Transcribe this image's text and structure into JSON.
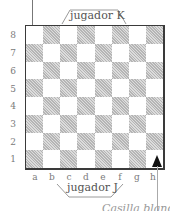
{
  "diagram": {
    "type": "chessboard",
    "top_player_label": "jugador K",
    "bottom_player_label": "jugador J",
    "bottom_caption_partial": "Casilla blanca",
    "ranks": [
      "8",
      "7",
      "6",
      "5",
      "4",
      "3",
      "2",
      "1"
    ],
    "files": [
      "a",
      "b",
      "c",
      "d",
      "e",
      "f",
      "g",
      "h"
    ],
    "corner_square_bottom_left": "dark",
    "arrows": [
      {
        "name": "arrow-to-a8",
        "direction": "down",
        "target": "a8"
      },
      {
        "name": "arrow-to-h1",
        "direction": "up",
        "target": "h1"
      }
    ],
    "colors": {
      "border": "#3a3a3a",
      "dark_square": "#c8c8c8",
      "light_square": "#ffffff",
      "text": "#6f6f6f"
    }
  }
}
